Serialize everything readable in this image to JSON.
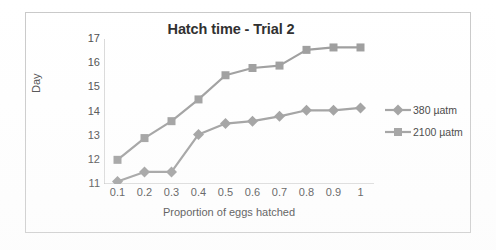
{
  "chart_data": {
    "type": "line",
    "title": "Hatch time - Trial 2",
    "xlabel": "Proportion of eggs hatched",
    "ylabel": "Day",
    "x": [
      0.1,
      0.2,
      0.3,
      0.4,
      0.5,
      0.6,
      0.7,
      0.8,
      0.9,
      1
    ],
    "xtick_labels": [
      "0.1",
      "0.2",
      "0.3",
      "0.4",
      "0.5",
      "0.6",
      "0.7",
      "0.8",
      "0.9",
      "1"
    ],
    "ytick_labels": [
      "11",
      "12",
      "13",
      "14",
      "15",
      "16",
      "17"
    ],
    "xlim": [
      0.05,
      1.05
    ],
    "ylim": [
      11,
      17
    ],
    "grid": false,
    "legend_position": "right",
    "series": [
      {
        "name": "380 µatm",
        "marker": "diamond",
        "color": "#9b9b9b",
        "values": [
          11.1,
          11.5,
          11.5,
          13.05,
          13.5,
          13.6,
          13.8,
          14.05,
          14.05,
          14.15
        ]
      },
      {
        "name": "2100 µatm",
        "marker": "square",
        "color": "#9b9b9b",
        "values": [
          12.0,
          12.9,
          13.6,
          14.5,
          15.5,
          15.8,
          15.9,
          16.55,
          16.65,
          16.65
        ]
      }
    ]
  },
  "legend": {
    "items": [
      {
        "label": "380 µatm"
      },
      {
        "label": "2100 µatm"
      }
    ]
  },
  "colors": {
    "series_line": "#9b9b9b",
    "axis": "#b4b4b4",
    "text": "#4a4a4a",
    "frame": "#c9c9c9"
  }
}
